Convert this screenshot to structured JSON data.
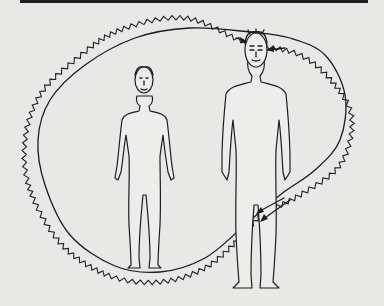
{
  "page": {
    "type": "scanned-illustration",
    "background_color": "#e8e8e6",
    "ink_color": "#1d1d1d"
  },
  "illustration": {
    "subject": "Two standing human figures enclosed by a smooth loop and a wavy loop; arrows point at the head and knee of the taller figure",
    "figures": [
      {
        "name": "small-figure",
        "role": "left, smaller person"
      },
      {
        "name": "large-figure",
        "role": "right, taller person"
      }
    ],
    "arrows": [
      {
        "name": "head-arrow-upper",
        "target": "head"
      },
      {
        "name": "head-arrow-lower",
        "target": "head"
      },
      {
        "name": "knee-arrow-upper",
        "target": "knee"
      },
      {
        "name": "knee-arrow-lower",
        "target": "knee"
      }
    ]
  }
}
